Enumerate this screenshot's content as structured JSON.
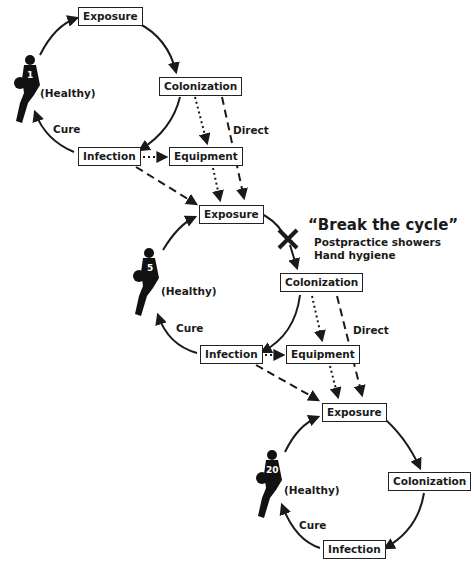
{
  "cycles": [
    {
      "player_number": "1",
      "status": "(Healthy)",
      "cure": "Cure",
      "exposure": "Exposure",
      "colonization": "Colonization",
      "infection": "Infection",
      "equipment": "Equipment",
      "direct": "Direct"
    },
    {
      "player_number": "5",
      "status": "(Healthy)",
      "cure": "Cure",
      "exposure": "Exposure",
      "colonization": "Colonization",
      "infection": "Infection",
      "equipment": "Equipment",
      "direct": "Direct"
    },
    {
      "player_number": "20",
      "status": "(Healthy)",
      "cure": "Cure",
      "exposure": "Exposure",
      "colonization": "Colonization",
      "infection": "Infection"
    }
  ],
  "break_cycle": {
    "title": "“Break the cycle”",
    "items": [
      "Postpractice showers",
      "Hand hygiene"
    ]
  }
}
